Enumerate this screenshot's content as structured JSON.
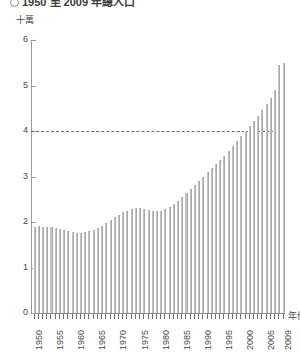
{
  "title": {
    "bullet": "circle-bullet",
    "text": "1950 至 2009 年總人口"
  },
  "axes": {
    "y_unit_label": "十萬",
    "x_axis_title": "年份",
    "y_ticks": [
      "0",
      "1",
      "2",
      "3",
      "4",
      "5",
      "6"
    ],
    "y_min": 0,
    "y_max": 6,
    "x_tick_labels": [
      "1950",
      "1955",
      "1960",
      "1965",
      "1970",
      "1975",
      "1980",
      "1985",
      "1990",
      "1995",
      "2000",
      "2005",
      "2009"
    ],
    "reference_line_value": 4
  },
  "chart_data": {
    "type": "bar",
    "title": "1950 至 2009 年總人口",
    "xlabel": "年份",
    "ylabel": "十萬",
    "ylim": [
      0,
      6
    ],
    "grid": false,
    "legend": "none",
    "annotations": [
      {
        "type": "dashed-horizontal-line",
        "value": 4,
        "label": ""
      }
    ],
    "categories": [
      "1950",
      "1951",
      "1952",
      "1953",
      "1954",
      "1955",
      "1956",
      "1957",
      "1958",
      "1959",
      "1960",
      "1961",
      "1962",
      "1963",
      "1964",
      "1965",
      "1966",
      "1967",
      "1968",
      "1969",
      "1970",
      "1971",
      "1972",
      "1973",
      "1974",
      "1975",
      "1976",
      "1977",
      "1978",
      "1979",
      "1980",
      "1981",
      "1982",
      "1983",
      "1984",
      "1985",
      "1986",
      "1987",
      "1988",
      "1989",
      "1990",
      "1991",
      "1992",
      "1993",
      "1994",
      "1995",
      "1996",
      "1997",
      "1998",
      "1999",
      "2000",
      "2001",
      "2002",
      "2003",
      "2004",
      "2005",
      "2006",
      "2007",
      "2008",
      "2009"
    ],
    "values": [
      1.9,
      1.91,
      1.9,
      1.89,
      1.88,
      1.86,
      1.84,
      1.82,
      1.8,
      1.78,
      1.76,
      1.76,
      1.78,
      1.8,
      1.83,
      1.87,
      1.92,
      1.98,
      2.04,
      2.1,
      2.16,
      2.21,
      2.25,
      2.28,
      2.3,
      2.31,
      2.29,
      2.27,
      2.25,
      2.24,
      2.25,
      2.29,
      2.34,
      2.4,
      2.47,
      2.55,
      2.64,
      2.73,
      2.82,
      2.91,
      3.0,
      3.09,
      3.18,
      3.27,
      3.36,
      3.45,
      3.55,
      3.66,
      3.77,
      3.88,
      3.99,
      4.1,
      4.22,
      4.34,
      4.46,
      4.59,
      4.73,
      4.9,
      5.45,
      5.5
    ],
    "x_tick_step_years": 5
  },
  "style": {
    "bar_fill": "#c2c2c2",
    "axis_color": "#8a8a8a",
    "text_color": "#4a4a4a",
    "reference_line_color": "#6d6d6d",
    "background": "#ffffff"
  }
}
